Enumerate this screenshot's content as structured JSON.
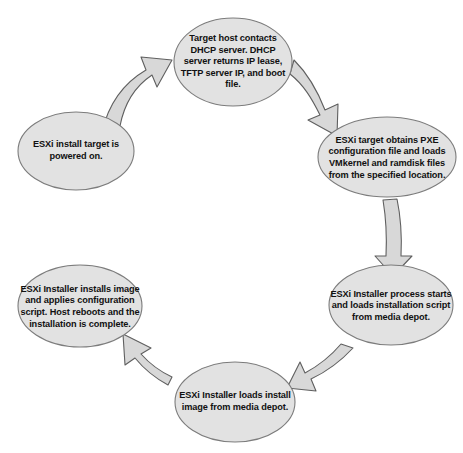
{
  "diagram": {
    "type": "cycle-flow",
    "colors": {
      "node_fill": "#e2e2e2",
      "node_stroke": "#7c7c7c",
      "arrow_fill": "#d8d8d8",
      "arrow_stroke": "#5f5f5f",
      "text": "#111111",
      "background": "#ffffff"
    },
    "nodes": [
      {
        "id": "node-top",
        "position": "top",
        "order": 2,
        "text": "Target host contacts DHCP server.  DHCP server returns IP lease, TFTP server IP, and boot file."
      },
      {
        "id": "node-right",
        "position": "right-upper",
        "order": 3,
        "text": "ESXi target obtains PXE configuration file and loads VMkernel and ramdisk files from the specified location."
      },
      {
        "id": "node-right-lower",
        "position": "right-lower",
        "order": 4,
        "text": "ESXi Installer process starts and loads installation script from media depot."
      },
      {
        "id": "node-bottom",
        "position": "bottom",
        "order": 5,
        "text": "ESXi Installer loads install image from media depot."
      },
      {
        "id": "node-left-lower",
        "position": "left-lower",
        "order": 6,
        "text": "ESXi Installer installs image and applies configuration script. Host reboots and the installation is complete."
      },
      {
        "id": "node-left-upper",
        "position": "left-upper",
        "order": 1,
        "text": "ESXi install target is powered on."
      }
    ],
    "arrows": [
      {
        "id": "arrow-1",
        "name": "arrow-left-upper-to-top",
        "from": "node-left-upper",
        "to": "node-top",
        "style": "curved-block",
        "direction": "up-right"
      },
      {
        "id": "arrow-2",
        "name": "arrow-top-to-right-upper",
        "from": "node-top",
        "to": "node-right",
        "style": "curved-block",
        "direction": "down-right"
      },
      {
        "id": "arrow-3",
        "name": "arrow-right-upper-to-right-lower",
        "from": "node-right",
        "to": "node-right-lower",
        "style": "straight-block",
        "direction": "down"
      },
      {
        "id": "arrow-4",
        "name": "arrow-right-lower-to-bottom",
        "from": "node-right-lower",
        "to": "node-bottom",
        "style": "curved-block",
        "direction": "down-left"
      },
      {
        "id": "arrow-5",
        "name": "arrow-bottom-to-left-lower",
        "from": "node-bottom",
        "to": "node-left-lower",
        "style": "curved-block",
        "direction": "up-left"
      }
    ]
  }
}
